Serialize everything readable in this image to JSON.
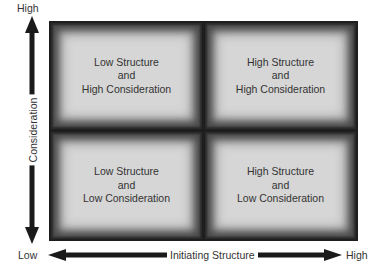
{
  "diagram": {
    "y_axis": {
      "title": "Consideration",
      "high_label": "High",
      "low_label": "Low"
    },
    "x_axis": {
      "title": "Initiating Structure",
      "high_label": "High",
      "low_label": "Low"
    },
    "quadrants": {
      "top_left": {
        "line1": "Low Structure",
        "line2": "and",
        "line3": "High Consideration"
      },
      "top_right": {
        "line1": "High Structure",
        "line2": "and",
        "line3": "High Consideration"
      },
      "bottom_left": {
        "line1": "Low Structure",
        "line2": "and",
        "line3": "Low Consideration"
      },
      "bottom_right": {
        "line1": "High Structure",
        "line2": "and",
        "line3": "Low Consideration"
      }
    },
    "colors": {
      "cell_fill": "#d6d6d6",
      "border": "#1e1e1e",
      "arrow": "#1a1a1a"
    }
  }
}
